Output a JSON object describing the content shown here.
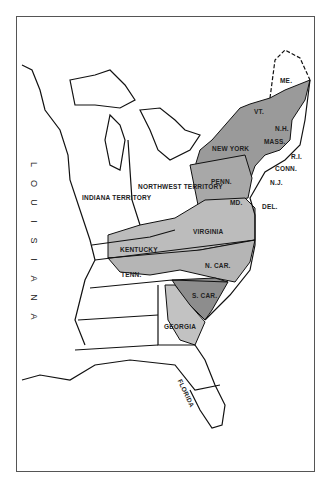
{
  "map": {
    "title": "",
    "regions": [
      {
        "id": "louisiana",
        "label": "LOUISIANA",
        "shade": "none"
      },
      {
        "id": "indiana-territory",
        "label": "INDIANA TERRITORY",
        "shade": "none"
      },
      {
        "id": "northwest-territory",
        "label": "NORTHWEST TERRITORY",
        "shade": "none"
      },
      {
        "id": "new-york",
        "label": "NEW YORK",
        "shade": "mixed"
      },
      {
        "id": "vermont",
        "label": "VT.",
        "shade": "mixed"
      },
      {
        "id": "new-hampshire",
        "label": "N.H.",
        "shade": "dark"
      },
      {
        "id": "maine",
        "label": "ME.",
        "shade": "mixed"
      },
      {
        "id": "massachusetts",
        "label": "MASS.",
        "shade": "dark"
      },
      {
        "id": "rhode-island",
        "label": "R.I.",
        "shade": "dark"
      },
      {
        "id": "connecticut",
        "label": "CONN.",
        "shade": "dark"
      },
      {
        "id": "new-jersey",
        "label": "N.J.",
        "shade": "mixed"
      },
      {
        "id": "pennsylvania",
        "label": "PENN.",
        "shade": "mixed"
      },
      {
        "id": "maryland",
        "label": "MD.",
        "shade": "dark"
      },
      {
        "id": "delaware",
        "label": "DEL.",
        "shade": "dark"
      },
      {
        "id": "virginia",
        "label": "VIRGINIA",
        "shade": "light"
      },
      {
        "id": "kentucky",
        "label": "KENTUCKY",
        "shade": "light"
      },
      {
        "id": "tennessee",
        "label": "TENN.",
        "shade": "light"
      },
      {
        "id": "north-carolina",
        "label": "N. CAR.",
        "shade": "mixed"
      },
      {
        "id": "south-carolina",
        "label": "S. CAR.",
        "shade": "dark"
      },
      {
        "id": "georgia",
        "label": "GEORGIA",
        "shade": "light"
      },
      {
        "id": "florida",
        "label": "FLORIDA",
        "shade": "none"
      }
    ],
    "vertical_label": [
      "L",
      "O",
      "U",
      "I",
      "S",
      "I",
      "A",
      "N",
      "A"
    ],
    "colors": {
      "dark": "#8a8a8a",
      "light": "#b9b9b9",
      "line": "#111111",
      "frame": "#555555"
    }
  }
}
